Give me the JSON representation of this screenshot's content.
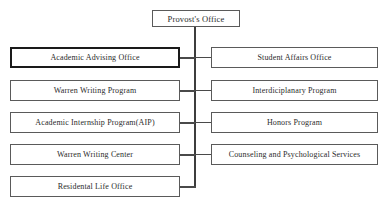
{
  "diagram": {
    "type": "organizational-chart",
    "root": {
      "label": "Provost's Office"
    },
    "left_column": [
      {
        "label": "Academic Advising Office",
        "emphasized": true
      },
      {
        "label": "Warren Writing Program",
        "emphasized": false
      },
      {
        "label": "Academic Internship Program(AIP)",
        "emphasized": false
      },
      {
        "label": "Warren Writing Center",
        "emphasized": false
      },
      {
        "label": "Residental Life Office",
        "emphasized": false
      }
    ],
    "right_column": [
      {
        "label": "Student Affairs Office"
      },
      {
        "label": "Interdiciplanary Program"
      },
      {
        "label": "Honors Program"
      },
      {
        "label": "Counseling and Psychological Services"
      }
    ],
    "colors": {
      "background": "#ffffff",
      "box_border": "#5a5a5a",
      "emphasis_border": "#1a1a1a",
      "connector": "#4a4a4a",
      "text": "#2b2b2b"
    }
  }
}
